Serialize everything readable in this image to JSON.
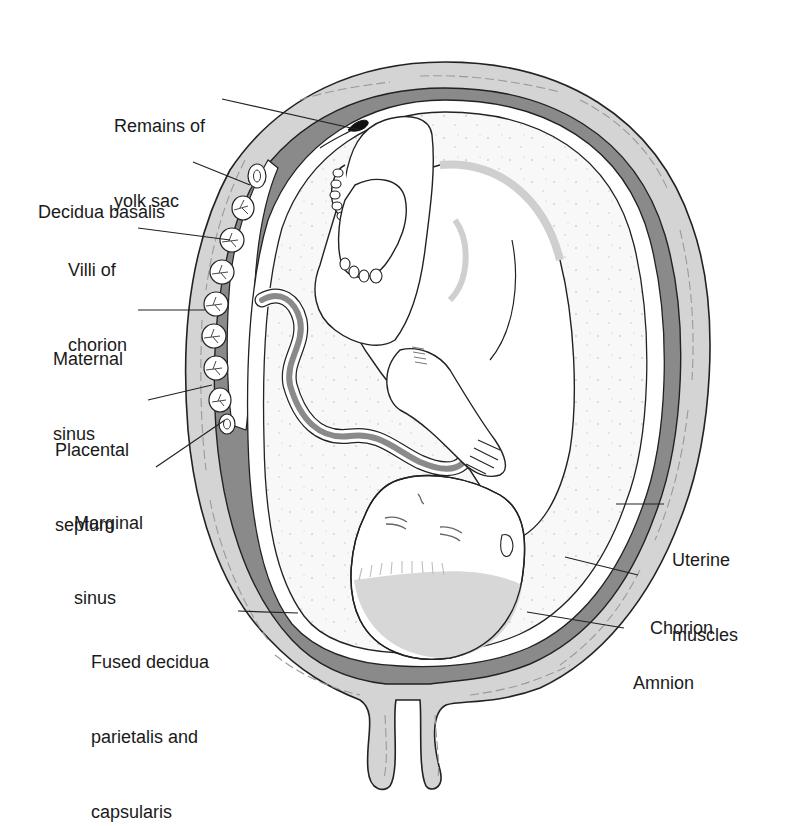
{
  "figure": {
    "colors": {
      "uterine_muscle": "#d4d4d4",
      "decidua": "#8a8a8a",
      "amniotic_fluid": "#f7f7f7",
      "fetus_shading": "#cfcfcf",
      "line": "#222222",
      "yolk_sac": "#111111"
    }
  },
  "labels": [
    {
      "id": "remains-of-yolk-sac",
      "lines": [
        "Remains of",
        "yolk sac"
      ],
      "x": 114,
      "y": 64,
      "align": "left",
      "leader": [
        [
          222,
          99
        ],
        [
          360,
          130
        ]
      ]
    },
    {
      "id": "decidua-basalis",
      "lines": [
        "Decidua basalis"
      ],
      "x": 38,
      "y": 150,
      "align": "left",
      "leader": [
        [
          193,
          162
        ],
        [
          250,
          185
        ]
      ]
    },
    {
      "id": "villi-of-chorion",
      "lines": [
        "Villi of",
        "chorion"
      ],
      "x": 68,
      "y": 208,
      "align": "left",
      "leader": [
        [
          138,
          228
        ],
        [
          230,
          240
        ]
      ]
    },
    {
      "id": "maternal-sinus",
      "lines": [
        "Maternal",
        "sinus"
      ],
      "x": 53,
      "y": 297,
      "align": "left",
      "leader": [
        [
          138,
          310
        ],
        [
          205,
          310
        ]
      ]
    },
    {
      "id": "placental-septum",
      "lines": [
        "Placental",
        "septum"
      ],
      "x": 55,
      "y": 388,
      "align": "left",
      "leader": [
        [
          148,
          400
        ],
        [
          212,
          385
        ]
      ]
    },
    {
      "id": "marginal-sinus",
      "lines": [
        "Marginal",
        "sinus"
      ],
      "x": 74,
      "y": 461,
      "align": "left",
      "leader": [
        [
          156,
          467
        ],
        [
          225,
          420
        ]
      ]
    },
    {
      "id": "fused-decidua",
      "lines": [
        "Fused decidua",
        "parietalis and",
        "capsularis"
      ],
      "x": 91,
      "y": 600,
      "align": "left",
      "leader": [
        [
          238,
          611
        ],
        [
          298,
          613
        ]
      ]
    },
    {
      "id": "uterine-muscles",
      "lines": [
        "Uterine",
        "muscles"
      ],
      "x": 672,
      "y": 498,
      "align": "left",
      "leader": [
        [
          664,
          504
        ],
        [
          616,
          504
        ]
      ]
    },
    {
      "id": "chorion",
      "lines": [
        "Chorion"
      ],
      "x": 650,
      "y": 566,
      "align": "left",
      "leader": [
        [
          638,
          575
        ],
        [
          565,
          557
        ]
      ]
    },
    {
      "id": "amnion",
      "lines": [
        "Amnion"
      ],
      "x": 633,
      "y": 621,
      "align": "left",
      "leader": [
        [
          624,
          628
        ],
        [
          527,
          612
        ]
      ]
    }
  ]
}
